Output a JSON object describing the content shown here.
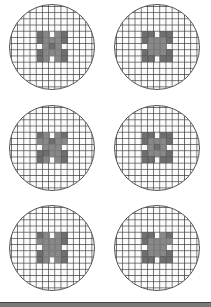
{
  "figure": {
    "dishes": [
      {
        "row": 1,
        "col": 1,
        "pattern": "x-cluster"
      },
      {
        "row": 1,
        "col": 2,
        "pattern": "x-cluster"
      },
      {
        "row": 2,
        "col": 1,
        "pattern": "x-cluster"
      },
      {
        "row": 2,
        "col": 2,
        "pattern": "x-cluster"
      },
      {
        "row": 3,
        "col": 1,
        "pattern": "x-cluster"
      },
      {
        "row": 3,
        "col": 2,
        "pattern": "x-cluster"
      }
    ],
    "colors": {
      "grid": "#3c3c3c",
      "fill": "#5f5f5f",
      "fill_light": "#7b7b7b",
      "bottom_bar": "#7a7a7a"
    }
  }
}
